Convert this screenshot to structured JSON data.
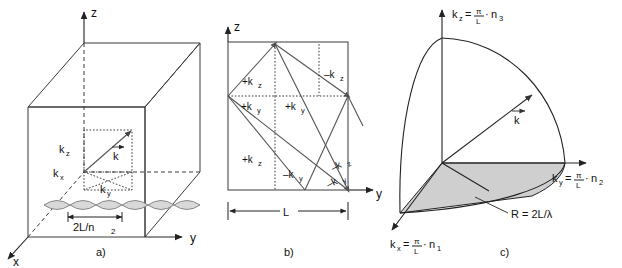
{
  "figure": {
    "background_color": "#ffffff",
    "line_color": "#3a3a3a",
    "shade_color": "#cfcfcf",
    "lobe_color": "#d9d9d9"
  },
  "panel_a": {
    "caption": "a)",
    "axes": {
      "x": "x",
      "y": "y",
      "z": "z"
    },
    "labels": {
      "kz": "k",
      "kz_sub": "z",
      "kx": "k",
      "kx_sub": "x",
      "ky": "k",
      "ky_sub": "y",
      "kvec": "k",
      "dimension": "2L/n",
      "dimension_sub": "2"
    },
    "lobe_count": 6
  },
  "panel_b": {
    "caption": "b)",
    "axes": {
      "y": "y",
      "z": "z"
    },
    "dimension": "L",
    "ray_labels": [
      {
        "id": "plus-kz-upper-left",
        "text": "+k",
        "sub": "z"
      },
      {
        "id": "plus-ky-left",
        "text": "+k",
        "sub": "y"
      },
      {
        "id": "plus-ky-mid",
        "text": "+k",
        "sub": "y"
      },
      {
        "id": "minus-kz-upper-right",
        "text": "–k",
        "sub": "z"
      },
      {
        "id": "plus-kz-lower-left",
        "text": "+k",
        "sub": "z"
      },
      {
        "id": "minus-ky-lower-mid",
        "text": "–k",
        "sub": "y"
      },
      {
        "id": "minus-kz-lower-right",
        "text": "–k",
        "sub": "z"
      },
      {
        "id": "minus-ky-lower-right",
        "text": "–k",
        "sub": "y"
      }
    ]
  },
  "panel_c": {
    "caption": "c)",
    "axis_labels": {
      "kz": {
        "lhs": "k",
        "lhs_sub": "z",
        "eq": "=",
        "num": "π",
        "den": "L",
        "dot": "·",
        "rhs": "n",
        "rhs_sub": "3"
      },
      "ky": {
        "lhs": "k",
        "lhs_sub": "y",
        "eq": "=",
        "num": "π",
        "den": "L",
        "dot": "·",
        "rhs": "n",
        "rhs_sub": "2"
      },
      "kx": {
        "lhs": "k",
        "lhs_sub": "x",
        "eq": "=",
        "num": "π",
        "den": "L",
        "dot": "·",
        "rhs": "n",
        "rhs_sub": "1"
      }
    },
    "kvec": "k",
    "radius_label": "R = 2L/λ"
  }
}
